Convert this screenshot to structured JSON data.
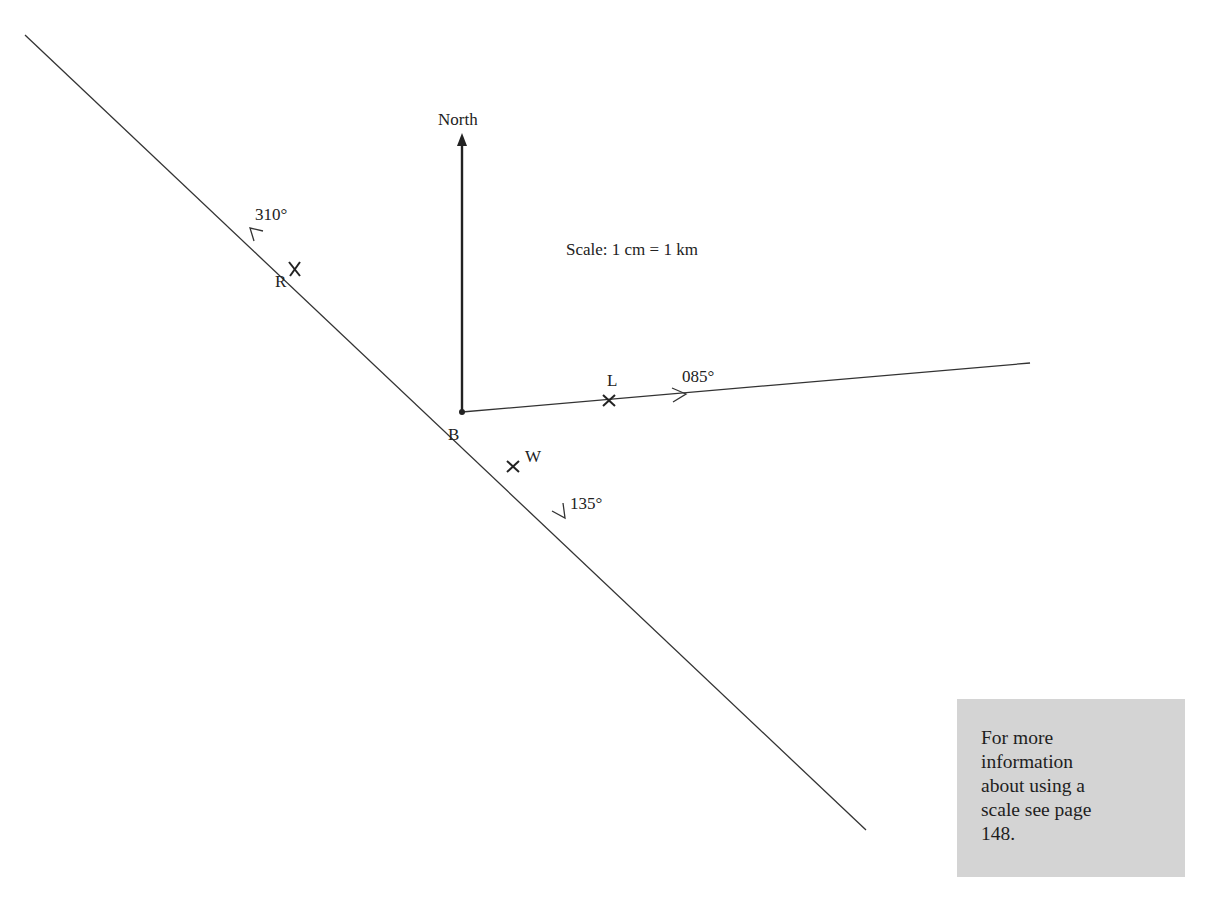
{
  "diagram": {
    "north_label": "North",
    "scale_label": "Scale: 1 cm = 1 km",
    "origin_label": "B",
    "bearings": [
      {
        "label": "310°",
        "point_label": "R"
      },
      {
        "label": "085°",
        "point_label": "L"
      },
      {
        "label": "135°",
        "point_label": "W"
      }
    ],
    "line_color": "#333333"
  },
  "info_box": {
    "lines": [
      "For more",
      "information",
      "about using a",
      "scale see page",
      "148."
    ],
    "background": "#d4d4d4"
  }
}
